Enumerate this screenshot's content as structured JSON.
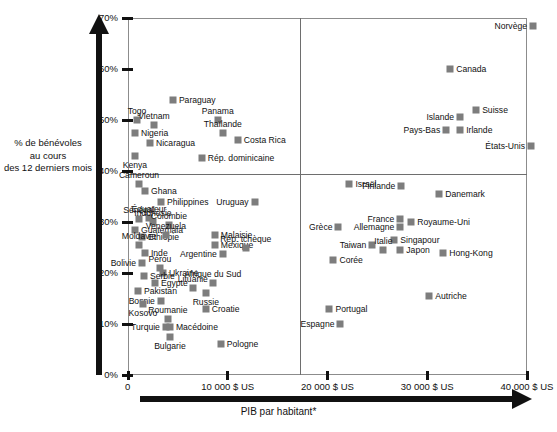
{
  "chart_data": {
    "type": "scatter",
    "title": "",
    "xlabel": "PIB par habitant*",
    "ylabel_lines": [
      "% de bénévoles",
      "au cours",
      "des 12 derniers mois"
    ],
    "xlim": [
      0,
      42000
    ],
    "ylim": [
      0,
      70
    ],
    "x_ticks": [
      {
        "value": 0,
        "label": "0"
      },
      {
        "value": 10000,
        "label": "10 000 $ US"
      },
      {
        "value": 20000,
        "label": "20 000 $ US"
      },
      {
        "value": 30000,
        "label": "30 000 $ US"
      },
      {
        "value": 40000,
        "label": "40 000 $ US"
      }
    ],
    "y_ticks": [
      {
        "value": 0,
        "label": "0%"
      },
      {
        "value": 10,
        "label": "10%"
      },
      {
        "value": 20,
        "label": "20%"
      },
      {
        "value": 30,
        "label": "30%"
      },
      {
        "value": 40,
        "label": "40%"
      },
      {
        "value": 50,
        "label": "50%"
      },
      {
        "value": 60,
        "label": "60%"
      },
      {
        "value": 70,
        "label": "70%"
      }
    ],
    "grid": false,
    "legend": "none",
    "quadrant_divider_x": 19000,
    "quadrant_divider_y": 40,
    "marker_color": "#7d7d7d",
    "axis_color": "#111111",
    "frame_color": "#8c8c8c",
    "points": [
      {
        "name": "Norvège",
        "x": 40600,
        "y": 68.5,
        "side": "left"
      },
      {
        "name": "Canada",
        "x": 32300,
        "y": 60.0,
        "side": "right"
      },
      {
        "name": "Suisse",
        "x": 34900,
        "y": 52.0,
        "side": "right"
      },
      {
        "name": "Islande",
        "x": 33300,
        "y": 50.5,
        "side": "left"
      },
      {
        "name": "Pays-Bas",
        "x": 31900,
        "y": 48.0,
        "side": "left"
      },
      {
        "name": "Irlande",
        "x": 33300,
        "y": 48.0,
        "side": "right"
      },
      {
        "name": "États-Unis",
        "x": 40400,
        "y": 45.0,
        "side": "left"
      },
      {
        "name": "Paraguay",
        "x": 4500,
        "y": 54.0,
        "side": "right"
      },
      {
        "name": "Panama",
        "x": 9000,
        "y": 50.0,
        "side": "above"
      },
      {
        "name": "Togo",
        "x": 900,
        "y": 50.0,
        "side": "above"
      },
      {
        "name": "Vietnam",
        "x": 2600,
        "y": 49.0,
        "side": "above"
      },
      {
        "name": "Thaïlande",
        "x": 9500,
        "y": 47.5,
        "side": "above"
      },
      {
        "name": "Nigeria",
        "x": 700,
        "y": 47.5,
        "side": "right"
      },
      {
        "name": "Costa Rica",
        "x": 11000,
        "y": 46.0,
        "side": "right"
      },
      {
        "name": "Nicaragua",
        "x": 2200,
        "y": 45.5,
        "side": "right"
      },
      {
        "name": "Kenya",
        "x": 700,
        "y": 43.0,
        "side": "below"
      },
      {
        "name": "Rép. dominicaine",
        "x": 7400,
        "y": 42.5,
        "side": "right"
      },
      {
        "name": "Cameroun",
        "x": 1100,
        "y": 37.5,
        "side": "above"
      },
      {
        "name": "Ghana",
        "x": 1700,
        "y": 36.0,
        "side": "right"
      },
      {
        "name": "Philippines",
        "x": 3300,
        "y": 34.0,
        "side": "right"
      },
      {
        "name": "Uruguay",
        "x": 12700,
        "y": 34.0,
        "side": "left"
      },
      {
        "name": "Sénégal",
        "x": 1100,
        "y": 30.5,
        "side": "above"
      },
      {
        "name": "Équateur",
        "x": 2100,
        "y": 30.8,
        "side": "above"
      },
      {
        "name": "Indonésie",
        "x": 2500,
        "y": 30.0,
        "side": "above"
      },
      {
        "name": "Colombie",
        "x": 4100,
        "y": 29.5,
        "side": "above"
      },
      {
        "name": "Guatemala",
        "x": 700,
        "y": 28.5,
        "side": "right"
      },
      {
        "name": "Éthiopie",
        "x": 1400,
        "y": 27.0,
        "side": "right"
      },
      {
        "name": "Venezuela",
        "x": 3800,
        "y": 27.5,
        "side": "above"
      },
      {
        "name": "Malaisie",
        "x": 8700,
        "y": 27.5,
        "side": "right"
      },
      {
        "name": "Moldavie",
        "x": 1100,
        "y": 25.5,
        "side": "above"
      },
      {
        "name": "Mexique",
        "x": 8700,
        "y": 25.5,
        "side": "right"
      },
      {
        "name": "Rép. tchèque",
        "x": 11800,
        "y": 25.0,
        "side": "above"
      },
      {
        "name": "Inde",
        "x": 1700,
        "y": 24.0,
        "side": "right"
      },
      {
        "name": "Argentine",
        "x": 9500,
        "y": 23.8,
        "side": "left"
      },
      {
        "name": "Bolivie",
        "x": 1400,
        "y": 22.0,
        "side": "left"
      },
      {
        "name": "Pérou",
        "x": 3200,
        "y": 21.0,
        "side": "above"
      },
      {
        "name": "Ukraine",
        "x": 3500,
        "y": 20.0,
        "side": "right"
      },
      {
        "name": "Serbie",
        "x": 1600,
        "y": 19.5,
        "side": "right"
      },
      {
        "name": "Égypte",
        "x": 2700,
        "y": 18.0,
        "side": "right"
      },
      {
        "name": "Lituanie",
        "x": 6500,
        "y": 17.0,
        "side": "above"
      },
      {
        "name": "Afrique du Sud",
        "x": 8500,
        "y": 18.0,
        "side": "above"
      },
      {
        "name": "Pakistan",
        "x": 1000,
        "y": 16.5,
        "side": "right"
      },
      {
        "name": "Russie",
        "x": 7800,
        "y": 16.0,
        "side": "below"
      },
      {
        "name": "Bosnie",
        "x": 3300,
        "y": 14.5,
        "side": "left"
      },
      {
        "name": "Kosovo",
        "x": 1500,
        "y": 14.0,
        "side": "below"
      },
      {
        "name": "Croatie",
        "x": 7800,
        "y": 13.0,
        "side": "right"
      },
      {
        "name": "Roumanie",
        "x": 4000,
        "y": 11.0,
        "side": "above"
      },
      {
        "name": "Turquie",
        "x": 3800,
        "y": 9.5,
        "side": "left"
      },
      {
        "name": "Macédoine",
        "x": 4200,
        "y": 9.5,
        "side": "right"
      },
      {
        "name": "Bulgarie",
        "x": 4200,
        "y": 7.5,
        "side": "below"
      },
      {
        "name": "Pologne",
        "x": 9300,
        "y": 6.0,
        "side": "right"
      },
      {
        "name": "Israël",
        "x": 22200,
        "y": 37.5,
        "side": "right"
      },
      {
        "name": "Finlande",
        "x": 27400,
        "y": 37.0,
        "side": "left"
      },
      {
        "name": "Danemark",
        "x": 31200,
        "y": 35.5,
        "side": "right"
      },
      {
        "name": "France",
        "x": 27300,
        "y": 30.5,
        "side": "left"
      },
      {
        "name": "Royaume-Uni",
        "x": 28400,
        "y": 30.0,
        "side": "right"
      },
      {
        "name": "Allemagne",
        "x": 27300,
        "y": 29.0,
        "side": "left"
      },
      {
        "name": "Grèce",
        "x": 21100,
        "y": 29.0,
        "side": "left"
      },
      {
        "name": "Singapour",
        "x": 26700,
        "y": 26.5,
        "side": "right"
      },
      {
        "name": "Taiwan",
        "x": 24500,
        "y": 25.5,
        "side": "left"
      },
      {
        "name": "Italie",
        "x": 25600,
        "y": 24.5,
        "side": "above"
      },
      {
        "name": "Japon",
        "x": 27300,
        "y": 24.5,
        "side": "right"
      },
      {
        "name": "Hong-Kong",
        "x": 31600,
        "y": 24.0,
        "side": "right"
      },
      {
        "name": "Corée",
        "x": 20600,
        "y": 22.5,
        "side": "right"
      },
      {
        "name": "Autriche",
        "x": 30200,
        "y": 15.5,
        "side": "right"
      },
      {
        "name": "Portugal",
        "x": 20200,
        "y": 13.0,
        "side": "right"
      },
      {
        "name": "Espagne",
        "x": 21300,
        "y": 10.0,
        "side": "left"
      }
    ]
  }
}
